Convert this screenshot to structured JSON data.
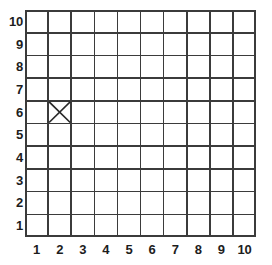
{
  "figure": {
    "name": "coordinate-grid",
    "background_color": "#ffffff",
    "line_color": "#3b3b3b",
    "label_color": "#1d1d1d"
  },
  "chart_data": {
    "type": "scatter",
    "title": "",
    "xlabel": "",
    "ylabel": "",
    "grid": true,
    "legend": null,
    "columns": 10,
    "rows": 10,
    "xlim": [
      0,
      10
    ],
    "ylim": [
      0,
      10
    ],
    "x_tick_labels": [
      "1",
      "2",
      "3",
      "4",
      "5",
      "6",
      "7",
      "8",
      "9",
      "10"
    ],
    "y_tick_labels": [
      "10",
      "9",
      "8",
      "7",
      "6",
      "5",
      "4",
      "3",
      "2",
      "1"
    ],
    "y_tick_labels_bottom_up": [
      "1",
      "2",
      "3",
      "4",
      "5",
      "6",
      "7",
      "8",
      "9",
      "10"
    ],
    "markers": [
      {
        "shape": "x",
        "label": "X",
        "column": 2,
        "row": 6,
        "x": 2,
        "y": 6,
        "color": "#2a2a2a"
      }
    ]
  }
}
